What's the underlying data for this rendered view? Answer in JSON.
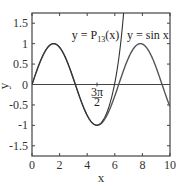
{
  "chart_data": {
    "type": "line",
    "title": "",
    "xlabel": "x",
    "ylabel": "y",
    "xlim": [
      0,
      10
    ],
    "ylim": [
      -1.75,
      1.75
    ],
    "xticks": [
      0,
      2,
      4,
      6,
      8,
      10
    ],
    "xtick_labels": [
      "0",
      "2",
      "4",
      "6",
      "8",
      "10"
    ],
    "yticks": [
      -1.5,
      -1,
      -0.5,
      0,
      0.5,
      1,
      1.5
    ],
    "ytick_labels": [
      "-1.5",
      "-1",
      "-0.5",
      "0",
      "0.5",
      "1",
      "1.5"
    ],
    "grid": false,
    "legend": null,
    "series": [
      {
        "name": "y = sin x",
        "function": "sin(x)",
        "x_range": [
          0,
          10
        ]
      },
      {
        "name": "y = P13(x)",
        "function": "Taylor polynomial of sin x of degree 13 about 0",
        "x_range": [
          0,
          10
        ]
      }
    ],
    "annotations": [
      {
        "text": "y = P13(x)",
        "x": 4.6,
        "y": 1.15
      },
      {
        "text": "y = sin x",
        "x": 8.3,
        "y": 1.15
      },
      {
        "text": "3π/2",
        "x": 4.71,
        "y": -0.2,
        "marker": "tick on x-axis line at 3π/2"
      }
    ],
    "reference_lines": [
      {
        "type": "horizontal",
        "y": 0
      }
    ]
  }
}
